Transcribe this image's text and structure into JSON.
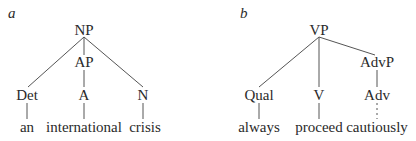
{
  "panels": [
    {
      "label": "a",
      "nodes": {
        "root": "NP",
        "mid": "AP",
        "leaf1": "Det",
        "leaf2": "A",
        "leaf3": "N",
        "word1": "an",
        "word2": "international",
        "word3": "crisis"
      }
    },
    {
      "label": "b",
      "nodes": {
        "root": "VP",
        "mid": "AdvP",
        "leaf1": "Qual",
        "leaf2": "V",
        "leaf3": "Adv",
        "word1": "always",
        "word2": "proceed",
        "word3": "cautiously"
      }
    }
  ],
  "colors": {
    "line": "#555555",
    "text": "#2a2a2a"
  }
}
